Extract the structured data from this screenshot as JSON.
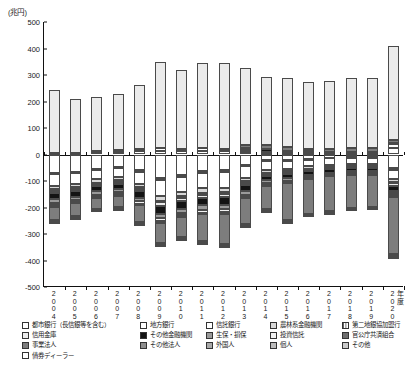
{
  "chart_data": {
    "type": "bar",
    "stacked": true,
    "title": "",
    "unit_label": "(兆円)",
    "xlabel": "年度",
    "ylabel": "",
    "ylim": [
      -500,
      500
    ],
    "yticks": [
      500,
      400,
      300,
      200,
      100,
      0,
      -100,
      -200,
      -300,
      -400,
      -500
    ],
    "ytick_labels": [
      "500",
      "400",
      "300",
      "200",
      "100",
      "0",
      "-100",
      "-200",
      "-300",
      "-400",
      "-500"
    ],
    "grid": false,
    "legend_position": "bottom",
    "categories": [
      "2004",
      "2005",
      "2006",
      "2007",
      "2008",
      "2009",
      "2010",
      "2011",
      "2012",
      "2013",
      "2014",
      "2015",
      "2016",
      "2017",
      "2018",
      "2019",
      "2020"
    ],
    "positive_totals": [
      245,
      211,
      218,
      230,
      264,
      348,
      318,
      344,
      347,
      327,
      292,
      288,
      272,
      278,
      290,
      290,
      410
    ],
    "negative_totals": [
      -252,
      -237,
      -209,
      -210,
      -262,
      -340,
      -318,
      -338,
      -352,
      -280,
      -222,
      -262,
      -240,
      -232,
      -218,
      -215,
      -390
    ],
    "series": [
      {
        "name": "都市銀行（長信銀等を含む）",
        "pattern": "crosshatch",
        "values": [
          -68,
          -66,
          -53,
          -47,
          -60,
          -88,
          -78,
          -62,
          -60,
          -38,
          -22,
          -20,
          -16,
          -12,
          -10,
          -10,
          -52
        ]
      },
      {
        "name": "地方銀行",
        "pattern": "white",
        "values": [
          -6,
          -5,
          -5,
          -5,
          -6,
          -8,
          -7,
          -7,
          -7,
          -5,
          -4,
          -4,
          -3,
          -3,
          -3,
          -3,
          -6
        ]
      },
      {
        "name": "信託銀行",
        "pattern": "dots-dense",
        "values": [
          -44,
          -40,
          -36,
          -34,
          -44,
          -60,
          -56,
          -58,
          -58,
          -44,
          -32,
          -30,
          -26,
          -24,
          -22,
          -22,
          -34
        ]
      },
      {
        "name": "農林系金融機関",
        "pattern": "lightgray",
        "values": [
          -14,
          -13,
          -12,
          -12,
          -14,
          -18,
          -17,
          -18,
          -18,
          -14,
          -11,
          -10,
          -9,
          -8,
          -8,
          -8,
          -12
        ]
      },
      {
        "name": "第二地銀協加盟行",
        "pattern": "vline",
        "values": [
          -5,
          -5,
          -4,
          -4,
          -5,
          -6,
          -6,
          -6,
          -6,
          -5,
          -4,
          -4,
          -3,
          -3,
          -3,
          -3,
          -5
        ]
      },
      {
        "name": "信用金庫",
        "pattern": "palegray",
        "values": [
          -10,
          -9,
          -9,
          -9,
          -10,
          -13,
          -12,
          -13,
          -13,
          -10,
          -8,
          -7,
          -6,
          -6,
          -6,
          -6,
          -9
        ]
      },
      {
        "name": "その他金融機関",
        "pattern": "black",
        "values": [
          -22,
          -21,
          -20,
          -20,
          -24,
          -30,
          -28,
          -28,
          -28,
          -22,
          -16,
          -15,
          -13,
          -12,
          -11,
          -11,
          -18
        ]
      },
      {
        "name": "生保・損保",
        "pattern": "midgray",
        "values": [
          -14,
          -13,
          -12,
          -12,
          -14,
          -18,
          -17,
          -17,
          -17,
          -13,
          -10,
          -9,
          -8,
          -8,
          -7,
          -7,
          -11
        ]
      },
      {
        "name": "投資信託",
        "pattern": "vlight",
        "values": [
          -8,
          -7,
          -7,
          -7,
          -8,
          -10,
          -9,
          -10,
          -10,
          -8,
          -6,
          -5,
          -5,
          -4,
          -4,
          -4,
          -7
        ]
      },
      {
        "name": "官公庁共済組合",
        "pattern": "darkgray",
        "values": [
          -6,
          -5,
          -5,
          -5,
          -6,
          -7,
          -7,
          -7,
          -7,
          -5,
          -4,
          -4,
          -3,
          -3,
          -3,
          -3,
          -5
        ]
      },
      {
        "name": "事業法人",
        "pattern": "gray70",
        "values": [
          -50,
          -48,
          -42,
          -44,
          -63,
          -75,
          -74,
          -100,
          -112,
          -100,
          -90,
          -140,
          -132,
          -130,
          -124,
          -120,
          -215
        ]
      },
      {
        "name": "その他法人",
        "pattern": "gray55",
        "values": [
          -3,
          -3,
          -2,
          -2,
          -3,
          -4,
          -4,
          -4,
          -4,
          -3,
          -3,
          -3,
          -2,
          -2,
          -2,
          -2,
          -4
        ]
      },
      {
        "name": "外国人",
        "pattern": "gray40",
        "values": [
          -1,
          -1,
          -1,
          -1,
          -2,
          -2,
          -2,
          -2,
          -2,
          -2,
          -2,
          -2,
          -2,
          -2,
          -2,
          -2,
          -3
        ]
      },
      {
        "name": "個人",
        "pattern": "gray85",
        "values": [
          -1,
          -1,
          -1,
          -1,
          -1,
          -1,
          -1,
          -1,
          -1,
          -1,
          -1,
          -1,
          -1,
          -1,
          -1,
          -1,
          -2
        ]
      },
      {
        "name": "その他",
        "pattern": "gray30",
        "values": [
          -1,
          -1,
          -1,
          -1,
          -1,
          -1,
          -1,
          -1,
          -1,
          -1,
          -1,
          -1,
          -1,
          -1,
          -1,
          -1,
          -2
        ]
      },
      {
        "name": "債券ディーラー",
        "pattern": "dotsfine",
        "values": [
          -1,
          -1,
          -1,
          -1,
          -1,
          -1,
          -1,
          -1,
          -1,
          -1,
          -1,
          -1,
          -1,
          -1,
          -1,
          -1,
          -1
        ]
      }
    ],
    "positive_series": [
      {
        "name": "都市銀行（長信銀等を含む）",
        "pattern": "crosshatch",
        "values": [
          2,
          2,
          8,
          10,
          12,
          14,
          12,
          14,
          12,
          10,
          6,
          5,
          4,
          4,
          4,
          4,
          26
        ]
      },
      {
        "name": "信託銀行",
        "pattern": "dots-dense",
        "values": [
          4,
          4,
          6,
          8,
          10,
          12,
          10,
          12,
          10,
          8,
          5,
          4,
          4,
          4,
          4,
          4,
          12
        ]
      },
      {
        "name": "その他金融機関",
        "pattern": "black",
        "values": [
          0,
          0,
          0,
          0,
          0,
          0,
          0,
          0,
          0,
          6,
          8,
          6,
          4,
          3,
          3,
          3,
          4
        ]
      },
      {
        "name": "事業法人",
        "pattern": "gray70",
        "values": [
          0,
          0,
          0,
          0,
          0,
          0,
          0,
          0,
          0,
          10,
          16,
          12,
          10,
          10,
          12,
          12,
          14
        ]
      },
      {
        "name": "その他（国債発行等）",
        "pattern": "palegray",
        "values": [
          239,
          205,
          204,
          212,
          242,
          322,
          296,
          318,
          325,
          293,
          257,
          261,
          250,
          257,
          267,
          267,
          354
        ]
      }
    ]
  },
  "legend": {
    "rows": [
      [
        {
          "label": "都市銀行（長信銀等を含む）",
          "pattern": "crosshatch",
          "width": 118
        },
        {
          "label": "地方銀行",
          "pattern": "white",
          "width": 66
        },
        {
          "label": "信託銀行",
          "pattern": "dots-dense",
          "width": 64
        },
        {
          "label": "農林系金融機関",
          "pattern": "lightgray",
          "width": 72
        },
        {
          "label": "第二地銀協加盟行",
          "pattern": "vline",
          "width": 68
        }
      ],
      [
        {
          "label": "信用金庫",
          "pattern": "palegray",
          "width": 118
        },
        {
          "label": "その他金融機関",
          "pattern": "black",
          "width": 66
        },
        {
          "label": "生保・損保",
          "pattern": "midgray",
          "width": 64
        },
        {
          "label": "投資信託",
          "pattern": "vlight",
          "width": 72
        },
        {
          "label": "官公庁共済組合",
          "pattern": "darkgray",
          "width": 68
        }
      ],
      [
        {
          "label": "事業法人",
          "pattern": "gray70",
          "width": 118
        },
        {
          "label": "その他法人",
          "pattern": "gray55",
          "width": 66
        },
        {
          "label": "外国人",
          "pattern": "gray40",
          "width": 64
        },
        {
          "label": "個人",
          "pattern": "gray85",
          "width": 72
        },
        {
          "label": "その他",
          "pattern": "gray30",
          "width": 68
        }
      ],
      [
        {
          "label": "債券ディーラー",
          "pattern": "dotsfine",
          "width": 118
        }
      ]
    ]
  }
}
